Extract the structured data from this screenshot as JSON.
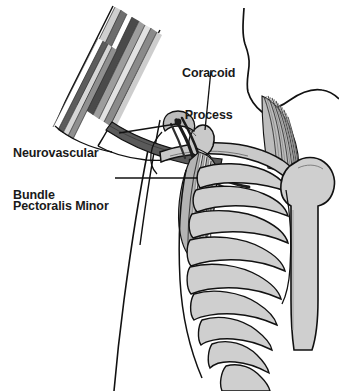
{
  "figure": {
    "type": "anatomical-illustration",
    "width": 339,
    "height": 391,
    "background": "#ffffff"
  },
  "labels": {
    "coracoid": {
      "line1": "Coracoid",
      "line2": "Process",
      "name": "coracoid-process"
    },
    "neurovascular": {
      "line1": "Neurovascular",
      "line2": "Bundle",
      "name": "neurovascular-bundle"
    },
    "pectoralis": {
      "line1": "Pectoralis Minor",
      "name": "pectoralis-minor"
    }
  },
  "colors": {
    "outline": "#111111",
    "bone_fill": "#c9c9c9",
    "bone_fill_light": "#d8d8d8",
    "muscle_dark": "#4f4f4f",
    "muscle_mid": "#8a8a8a",
    "muscle_light": "#c0c0c0",
    "white": "#ffffff",
    "text": "#1a1a1a",
    "leader": "#111111"
  },
  "structures": [
    {
      "name": "upper-arm-muscle-bands",
      "description": "Striped deltoid and biceps bands running diagonally from upper left"
    },
    {
      "name": "clavicle",
      "description": "Horizontal bone crossing the shoulder"
    },
    {
      "name": "coracoid-process",
      "description": "Hook-shaped bony projection of the scapula"
    },
    {
      "name": "neurovascular-bundle",
      "description": "Dark cord of nerves and vessels passing under the clavicle"
    },
    {
      "name": "pectoralis-minor-muscle",
      "description": "Fan of striated fibers from coracoid to ribs 3-5"
    },
    {
      "name": "rib-cage",
      "description": "Nine curved ribs descending on the right"
    },
    {
      "name": "humerus",
      "description": "Upper arm bone head and shaft on the far right"
    },
    {
      "name": "neck-jaw-outline",
      "description": "Contour of neck and jaw at top right"
    },
    {
      "name": "torso-contour",
      "description": "Body outline descending at lower left"
    }
  ],
  "leader_lines": [
    {
      "name": "coracoid-leader",
      "from": "Coracoid Process label",
      "to": "coracoid process"
    },
    {
      "name": "neurovascular-leader",
      "from": "Neurovascular Bundle label",
      "to": "neurovascular bundle"
    },
    {
      "name": "pectoralis-leader",
      "from": "Pectoralis Minor label",
      "to": "pectoralis minor muscle"
    }
  ]
}
